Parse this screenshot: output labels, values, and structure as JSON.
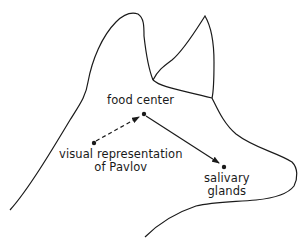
{
  "diagram": {
    "colors": {
      "line": "#1a1a1a",
      "background": "#ffffff"
    },
    "nodes": [
      {
        "id": "food_center",
        "label": "food center",
        "x": 144,
        "y": 114
      },
      {
        "id": "visual_representation",
        "label_line1": "visual representation",
        "label_line2": "of Pavlov",
        "x": 93,
        "y": 143
      },
      {
        "id": "salivary_glands",
        "label_line1": "salivary",
        "label_line2": "glands",
        "x": 224,
        "y": 166
      }
    ],
    "edges": [
      {
        "from": "visual_representation",
        "to": "food_center",
        "style": "dashed",
        "arrow": "end"
      },
      {
        "from": "food_center",
        "to": "salivary_glands",
        "style": "solid",
        "arrow": "end"
      }
    ]
  }
}
